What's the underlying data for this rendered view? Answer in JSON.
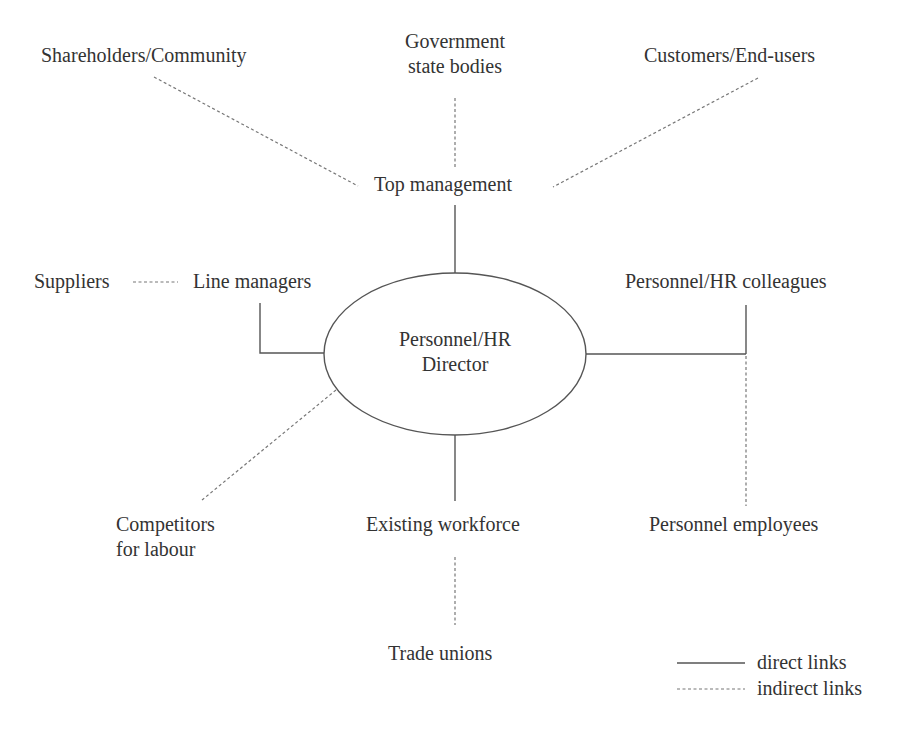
{
  "diagram": {
    "type": "stakeholder-map",
    "center_node": {
      "line1": "Personnel/HR",
      "line2": "Director"
    },
    "nodes": {
      "shareholders": "Shareholders/Community",
      "government_line1": "Government",
      "government_line2": "state bodies",
      "customers": "Customers/End-users",
      "top_management": "Top management",
      "suppliers": "Suppliers",
      "line_managers": "Line managers",
      "hr_colleagues": "Personnel/HR colleagues",
      "competitors_line1": "Competitors",
      "competitors_line2": "for labour",
      "existing_workforce": "Existing workforce",
      "personnel_employees": "Personnel employees",
      "trade_unions": "Trade unions"
    },
    "links": [
      {
        "from": "Personnel/HR Director",
        "to": "Top management",
        "type": "direct"
      },
      {
        "from": "Personnel/HR Director",
        "to": "Line managers",
        "type": "direct"
      },
      {
        "from": "Personnel/HR Director",
        "to": "Personnel/HR colleagues",
        "type": "direct"
      },
      {
        "from": "Personnel/HR Director",
        "to": "Existing workforce",
        "type": "direct"
      },
      {
        "from": "Personnel/HR Director",
        "to": "Competitors for labour",
        "type": "indirect"
      },
      {
        "from": "Personnel/HR Director",
        "to": "Personnel employees",
        "type": "indirect"
      },
      {
        "from": "Top management",
        "to": "Shareholders/Community",
        "type": "indirect"
      },
      {
        "from": "Top management",
        "to": "Government state bodies",
        "type": "indirect"
      },
      {
        "from": "Top management",
        "to": "Customers/End-users",
        "type": "indirect"
      },
      {
        "from": "Line managers",
        "to": "Suppliers",
        "type": "indirect"
      },
      {
        "from": "Existing workforce",
        "to": "Trade unions",
        "type": "indirect"
      }
    ],
    "legend": {
      "direct": "direct links",
      "indirect": "indirect links"
    },
    "colors": {
      "line": "#555555",
      "text": "#333333",
      "background": "#ffffff"
    }
  }
}
